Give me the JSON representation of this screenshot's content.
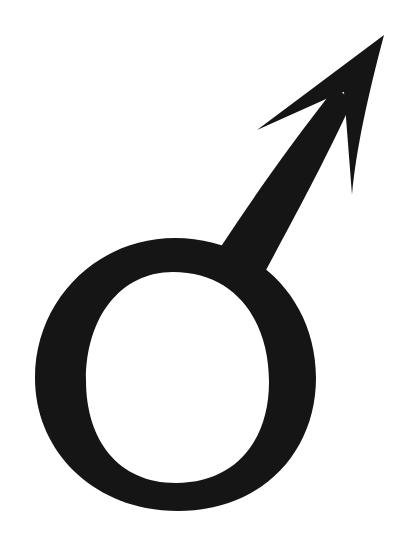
{
  "symbol": {
    "name": "male-symbol",
    "label": "Male symbol (Mars)",
    "fill_color": "#151515",
    "background_color": "#ffffff"
  }
}
